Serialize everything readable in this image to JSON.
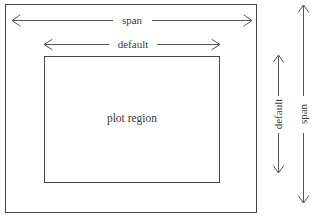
{
  "diagram": {
    "outer_box": {
      "name": "span-box",
      "x": 5,
      "y": 4,
      "width": 252,
      "height": 209
    },
    "inner_box": {
      "name": "plot-region-box",
      "label": "plot region",
      "x": 44,
      "y": 56,
      "width": 176,
      "height": 127
    },
    "labels": {
      "span_horizontal": "span",
      "default_horizontal": "default",
      "default_vertical": "default",
      "span_vertical": "span",
      "plot_region": "plot region"
    },
    "arrows": [
      {
        "name": "span-horizontal-arrow",
        "label": "span",
        "orientation": "horizontal",
        "from": 12,
        "to": 252,
        "axis_pos": 20,
        "double_headed": true
      },
      {
        "name": "default-horizontal-arrow",
        "label": "default",
        "orientation": "horizontal",
        "from": 44,
        "to": 220,
        "axis_pos": 44,
        "double_headed": true
      },
      {
        "name": "default-vertical-arrow",
        "label": "default",
        "orientation": "vertical",
        "from": 55,
        "to": 173,
        "axis_pos": 278,
        "double_headed": true
      },
      {
        "name": "span-vertical-arrow",
        "label": "span",
        "orientation": "vertical",
        "from": 5,
        "to": 203,
        "axis_pos": 303,
        "double_headed": true
      }
    ],
    "colors": {
      "line": "#444444",
      "arrow": "#555555",
      "text": "#3a3a3a",
      "background": "#ffffff"
    }
  }
}
